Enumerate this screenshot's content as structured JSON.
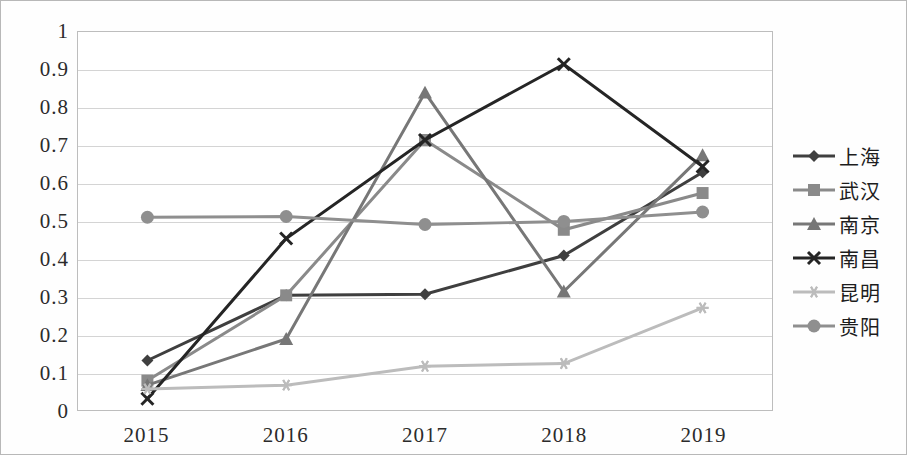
{
  "chart_data": {
    "type": "line",
    "title": "",
    "xlabel": "",
    "ylabel": "",
    "categories": [
      "2015",
      "2016",
      "2017",
      "2018",
      "2019"
    ],
    "x_tick_labels": [
      "2015",
      "2016",
      "2017",
      "2018",
      "2019"
    ],
    "y_tick_labels": [
      "1",
      "0.9",
      "0.8",
      "0.7",
      "0.6",
      "0.5",
      "0.4",
      "0.3",
      "0.2",
      "0.1",
      "0"
    ],
    "y_tick_values": [
      1,
      0.9,
      0.8,
      0.7,
      0.6,
      0.5,
      0.4,
      0.3,
      0.2,
      0.1,
      0
    ],
    "ylim": [
      0,
      1
    ],
    "grid": true,
    "legend_position": "right",
    "series": [
      {
        "name": "上海",
        "marker": "diamond",
        "color": "#3f3f3f",
        "values": [
          0.133,
          0.305,
          0.308,
          0.41,
          0.63
        ]
      },
      {
        "name": "武汉",
        "marker": "square",
        "color": "#8a8a8a",
        "values": [
          0.08,
          0.305,
          0.715,
          0.478,
          0.575
        ]
      },
      {
        "name": "南京",
        "marker": "triangle",
        "color": "#777777",
        "values": [
          0.068,
          0.19,
          0.84,
          0.315,
          0.675
        ]
      },
      {
        "name": "南昌",
        "marker": "x",
        "color": "#252525",
        "values": [
          0.032,
          0.455,
          0.715,
          0.915,
          0.645
        ]
      },
      {
        "name": "昆明",
        "marker": "asterisk",
        "color": "#bcbcbc",
        "values": [
          0.058,
          0.068,
          0.118,
          0.125,
          0.272
        ]
      },
      {
        "name": "贵阳",
        "marker": "circle",
        "color": "#8f8f8f",
        "values": [
          0.511,
          0.513,
          0.492,
          0.5,
          0.525
        ]
      }
    ]
  },
  "legend": {
    "items": [
      {
        "label": "上海",
        "marker_name": "diamond-marker-icon"
      },
      {
        "label": "武汉",
        "marker_name": "square-marker-icon"
      },
      {
        "label": "南京",
        "marker_name": "triangle-marker-icon"
      },
      {
        "label": "南昌",
        "marker_name": "x-marker-icon"
      },
      {
        "label": "昆明",
        "marker_name": "asterisk-marker-icon"
      },
      {
        "label": "贵阳",
        "marker_name": "circle-marker-icon"
      }
    ]
  }
}
